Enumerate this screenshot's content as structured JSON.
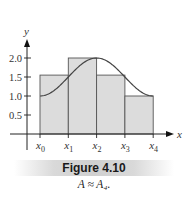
{
  "chart_data": {
    "type": "bar",
    "subtype": "riemann-sum-with-curve",
    "title": "Figure 4.10",
    "subtitle": "A ≈ A₄.",
    "xlabel": "x",
    "ylabel": "y",
    "x_tick_labels": [
      "x0",
      "x1",
      "x2",
      "x3",
      "x4"
    ],
    "y_ticks": [
      0.5,
      1.0,
      1.5,
      2.0
    ],
    "y_tick_labels": [
      "0.5",
      "1.0",
      "1.5",
      "2.0"
    ],
    "ylim": [
      0,
      2.3
    ],
    "grid": false,
    "rectangles": [
      {
        "from": "x0",
        "to": "x1",
        "height": 1.55
      },
      {
        "from": "x1",
        "to": "x2",
        "height": 2.0
      },
      {
        "from": "x2",
        "to": "x3",
        "height": 1.55
      },
      {
        "from": "x3",
        "to": "x4",
        "height": 1.0
      }
    ],
    "curve": {
      "description": "smooth curve rising from 1.0 at x0 to a maximum 2.0 at x2, falling back to 1.0 at x4",
      "points": [
        [
          0,
          1.0
        ],
        [
          1,
          1.55
        ],
        [
          2,
          2.0
        ],
        [
          3,
          1.55
        ],
        [
          4,
          1.0
        ]
      ]
    },
    "colors": {
      "fill": "#dcdcdc",
      "stroke": "#555555",
      "curve": "#444444",
      "axis": "#222222"
    }
  },
  "figure": {
    "caption_title": "Figure 4.10",
    "caption_text": "A ≈ A₄."
  }
}
